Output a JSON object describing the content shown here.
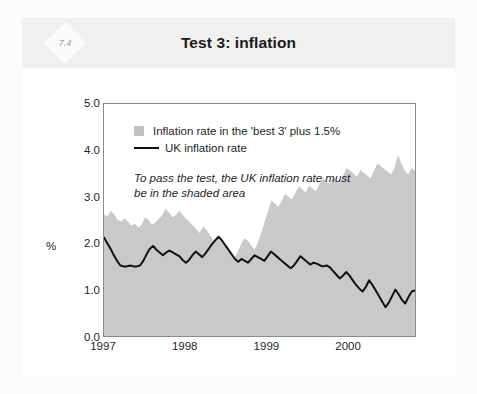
{
  "figure": {
    "number": "7.4",
    "title": "Test 3: inflation"
  },
  "chart_data": {
    "type": "area",
    "title": "Test 3: inflation",
    "xlabel": "",
    "ylabel": "%",
    "ylim": [
      0.0,
      5.0
    ],
    "yticks": [
      "0.0",
      "1.0",
      "2.0",
      "3.0",
      "4.0",
      "5.0"
    ],
    "xlim": [
      1997.0,
      2000.83
    ],
    "xticks": [
      "1997",
      "1998",
      "1999",
      "2000"
    ],
    "grid": false,
    "legend_position": "top-left-inside",
    "annotation": "To pass the test, the UK inflation rate must be in the shaded area",
    "series": [
      {
        "name": "Inflation rate in the 'best 3' plus 1.5%",
        "type": "area",
        "color": "#c9c9c9",
        "fill_from": 0.0,
        "values": [
          2.62,
          2.58,
          2.7,
          2.62,
          2.5,
          2.46,
          2.54,
          2.46,
          2.38,
          2.42,
          2.34,
          2.4,
          2.56,
          2.5,
          2.4,
          2.44,
          2.52,
          2.6,
          2.74,
          2.66,
          2.56,
          2.6,
          2.7,
          2.62,
          2.52,
          2.46,
          2.38,
          2.3,
          2.22,
          2.36,
          2.28,
          2.18,
          2.06,
          2.14,
          2.06,
          1.96,
          1.86,
          1.76,
          1.66,
          1.8,
          1.96,
          2.1,
          2.06,
          1.96,
          1.86,
          2.0,
          2.22,
          2.46,
          2.7,
          2.92,
          2.86,
          2.78,
          2.92,
          3.06,
          3.0,
          2.94,
          3.08,
          3.22,
          3.16,
          3.1,
          3.24,
          3.18,
          3.12,
          3.26,
          3.4,
          3.34,
          3.28,
          3.42,
          3.36,
          3.3,
          3.46,
          3.62,
          3.56,
          3.5,
          3.44,
          3.58,
          3.52,
          3.46,
          3.4,
          3.56,
          3.72,
          3.66,
          3.6,
          3.54,
          3.48,
          3.62,
          3.9,
          3.72,
          3.56,
          3.48,
          3.62,
          3.56
        ]
      },
      {
        "name": "UK inflation rate",
        "type": "line",
        "color": "#111111",
        "values": [
          2.12,
          2.0,
          1.88,
          1.74,
          1.62,
          1.52,
          1.5,
          1.5,
          1.52,
          1.5,
          1.5,
          1.52,
          1.62,
          1.76,
          1.88,
          1.94,
          1.86,
          1.8,
          1.74,
          1.8,
          1.84,
          1.8,
          1.76,
          1.72,
          1.64,
          1.58,
          1.64,
          1.74,
          1.82,
          1.76,
          1.7,
          1.78,
          1.88,
          1.98,
          2.06,
          2.14,
          2.06,
          1.96,
          1.86,
          1.76,
          1.66,
          1.6,
          1.66,
          1.62,
          1.58,
          1.66,
          1.74,
          1.7,
          1.66,
          1.62,
          1.72,
          1.82,
          1.76,
          1.7,
          1.64,
          1.58,
          1.52,
          1.46,
          1.52,
          1.62,
          1.72,
          1.66,
          1.6,
          1.54,
          1.58,
          1.56,
          1.52,
          1.5,
          1.52,
          1.48,
          1.4,
          1.32,
          1.24,
          1.3,
          1.38,
          1.3,
          1.2,
          1.1,
          1.02,
          0.96,
          1.06,
          1.2,
          1.1,
          0.98,
          0.86,
          0.74,
          0.62,
          0.72,
          0.86,
          1.0,
          0.9,
          0.78,
          0.7,
          0.84,
          0.96,
          0.98
        ]
      }
    ]
  },
  "legend": [
    {
      "marker": "swatch",
      "label": "Inflation rate in the 'best 3' plus 1.5%"
    },
    {
      "marker": "line",
      "label": "UK inflation rate"
    }
  ],
  "annotation_lines": [
    "To pass the test, the UK inflation rate must",
    "be in the shaded area"
  ],
  "axis": {
    "y_label": "%",
    "y_ticks": [
      "5.0",
      "4.0",
      "3.0",
      "2.0",
      "1.0",
      "0.0"
    ],
    "x_ticks": [
      "1997",
      "1998",
      "1999",
      "2000"
    ]
  },
  "colors": {
    "area_fill": "#c9c9c9",
    "line": "#111111",
    "frame": "#8b8b8b",
    "header_band": "#f0f0f1",
    "text": "#1f1f1f"
  }
}
